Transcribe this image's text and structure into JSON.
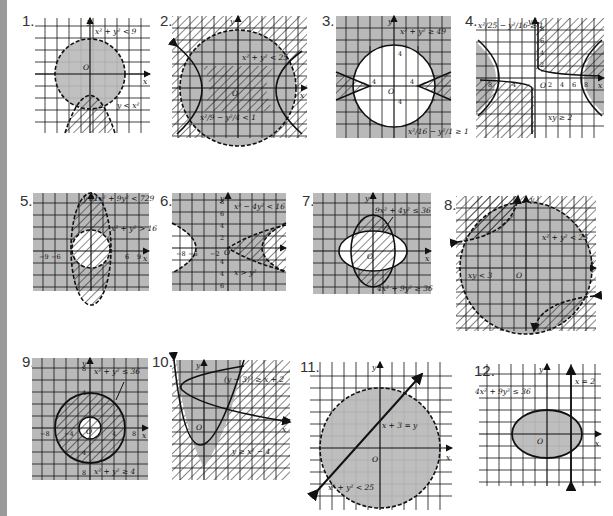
{
  "page": {
    "colors": {
      "shade": "#b9b9b9",
      "grid": "#111111",
      "background": "#ffffff",
      "binding": "#9a9a9a"
    }
  },
  "figures": [
    {
      "number": "1.",
      "labels": [
        "x² + y² < 9",
        "y < x²"
      ],
      "origin": "O",
      "axes": [
        "x",
        "y"
      ]
    },
    {
      "number": "2.",
      "labels": [
        "x² + y² < 25",
        "x²/9 − y²/4 < 1"
      ],
      "origin": "O",
      "axes": [
        "x",
        "y"
      ]
    },
    {
      "number": "3.",
      "labels": [
        "x² + y² ≥ 49",
        "x²/16 − y²/1 ≥ 1"
      ],
      "origin": "O",
      "axes": [
        "x",
        "y"
      ],
      "ticks": [
        "4",
        "4",
        "4",
        "4"
      ]
    },
    {
      "number": "4.",
      "labels": [
        "x²/25 − y²/16 ≥ 1",
        "xy ≥ 2"
      ],
      "origin": "O",
      "axes": [
        "x",
        "y"
      ],
      "ticks": [
        "8",
        "6",
        "4",
        "2",
        "2",
        "4",
        "6",
        "8",
        "8",
        "4"
      ]
    },
    {
      "number": "5.",
      "labels": [
        "81x² + 9y² < 729",
        "x² + y² > 16"
      ],
      "origin": "O",
      "axes": [
        "x",
        "y"
      ],
      "ticks": [
        "−9",
        "−6",
        "6",
        "9"
      ]
    },
    {
      "number": "6.",
      "labels": [
        "x² − 4y² < 16",
        "x > y²"
      ],
      "origin": "O",
      "axes": [
        "x",
        "y"
      ],
      "ticks": [
        "8",
        "6",
        "4",
        "2",
        "−8",
        "−6",
        "−2",
        "2",
        "4",
        "6",
        "8",
        "4",
        "6",
        "8"
      ]
    },
    {
      "number": "7.",
      "labels": [
        "9x² + 4y² ≤ 36",
        "4x² + 9y² ≥ 36"
      ],
      "origin": "O",
      "axes": [
        "x",
        "y"
      ]
    },
    {
      "number": "8.",
      "labels": [
        "x² + y² < 25",
        "xy < 3"
      ],
      "origin": "O",
      "axes": [
        "x",
        "y"
      ]
    },
    {
      "number": "9.",
      "labels": [
        "x² + y² ≤ 36",
        "x² + y² ≥ 4"
      ],
      "origin": "O",
      "axes": [
        "x",
        "y"
      ],
      "ticks": [
        "8",
        "4",
        "−8",
        "−4",
        "4",
        "8",
        "4",
        "8"
      ]
    },
    {
      "number": "10.",
      "labels": [
        "(y − 3)² ≥ x + 2",
        "y ≥ x² − 4"
      ],
      "origin": "O",
      "axes": [
        "x",
        "y"
      ]
    },
    {
      "number": "11.",
      "labels": [
        "x + 3 = y",
        "x² + y² < 25"
      ],
      "origin": "O",
      "axes": [
        "x",
        "y"
      ]
    },
    {
      "number": "12.",
      "labels": [
        "4x² + 9y² ≤ 36",
        "x = 2"
      ],
      "origin": "O",
      "axes": [
        "x",
        "y"
      ]
    }
  ]
}
